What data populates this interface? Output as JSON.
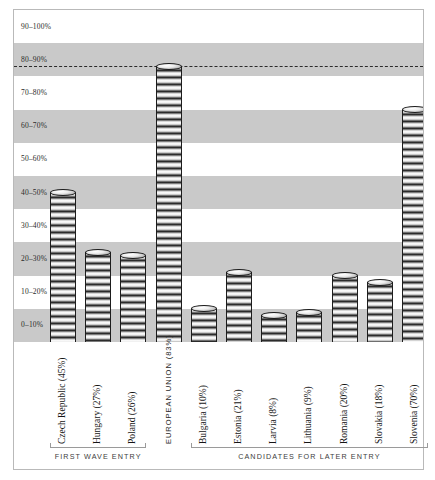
{
  "chart_data": {
    "type": "bar",
    "title": "",
    "xlabel": "",
    "ylabel": "",
    "ylim": [
      0,
      100
    ],
    "grid": "horizontal alternating shaded bands, 10% each",
    "legend": "none",
    "categories": [
      "Czech Republic (45%)",
      "Hungary (27%)",
      "Poland (26%)",
      "EUROPEAN UNION (83%)",
      "Bulgaria (10%)",
      "Estonia (21%)",
      "Larvia (8%)",
      "Lithuania (9%)",
      "Romania (20%)",
      "Slovakia (18%)",
      "Slovenia (70%)"
    ],
    "values": [
      45,
      27,
      26,
      83,
      10,
      21,
      8,
      9,
      20,
      18,
      70
    ],
    "ytick_labels": [
      "0–10%",
      "10–20%",
      "20–30%",
      "30–40%",
      "40–50%",
      "50–60%",
      "60–70%",
      "70–80%",
      "80–90%",
      "90–100%"
    ],
    "annotations": [
      {
        "name": "eu-reference-line",
        "type": "dashed-horizontal-line",
        "value": 83
      }
    ],
    "groups": [
      {
        "label": "FIRST WAVE ENTRY",
        "from": 0,
        "to": 2
      },
      {
        "label": "CANDIDATES FOR LATER ENTRY",
        "from": 4,
        "to": 10
      }
    ]
  },
  "style": {
    "band_shaded": "#c9c9c9",
    "band_plain": "#ffffff",
    "frame": "#b9b9b9",
    "bar_outline": "#1d1d1d",
    "dash_line": "#2b2b2b"
  }
}
